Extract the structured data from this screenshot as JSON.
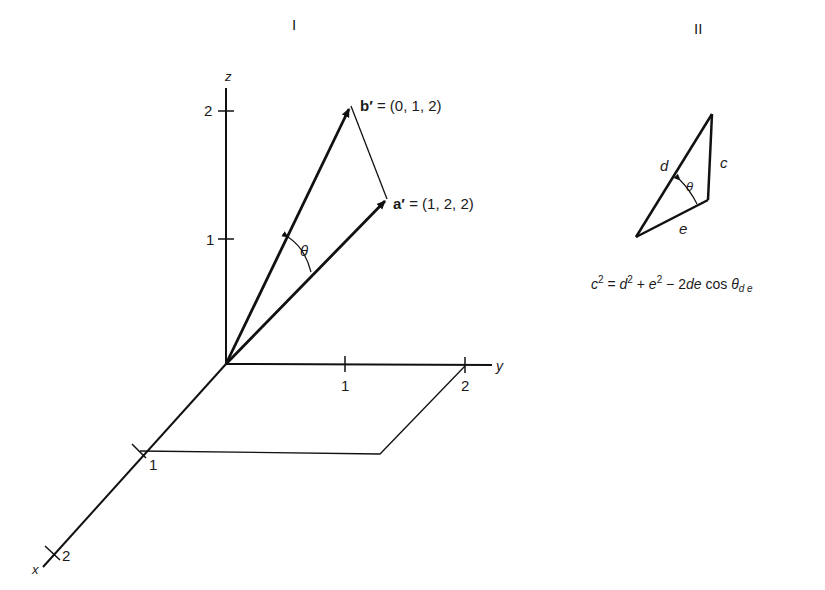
{
  "panels": {
    "left": {
      "title": "I",
      "axes": {
        "x": {
          "label": "x",
          "ticks": [
            "1",
            "2"
          ]
        },
        "y": {
          "label": "y",
          "ticks": [
            "1",
            "2"
          ]
        },
        "z": {
          "label": "z",
          "ticks": [
            "1",
            "2"
          ]
        }
      },
      "vectors": {
        "b": {
          "name": "b′",
          "equals": "= (0, 1, 2)"
        },
        "a": {
          "name": "a′",
          "equals": "= (1, 2, 2)"
        }
      },
      "angle_label": "θ"
    },
    "right": {
      "title": "II",
      "triangle": {
        "side_d": "d",
        "side_c": "c",
        "side_e": "e",
        "angle": "θ"
      },
      "formula": {
        "c": "c",
        "c_exp": "2",
        "eq": " = ",
        "d": "d",
        "d_exp": "2",
        "plus": " + ",
        "e": "e",
        "e_exp": "2",
        "minus": " − 2",
        "de": "de",
        "cos": " cos ",
        "theta": "θ",
        "sub": "d e"
      }
    }
  }
}
